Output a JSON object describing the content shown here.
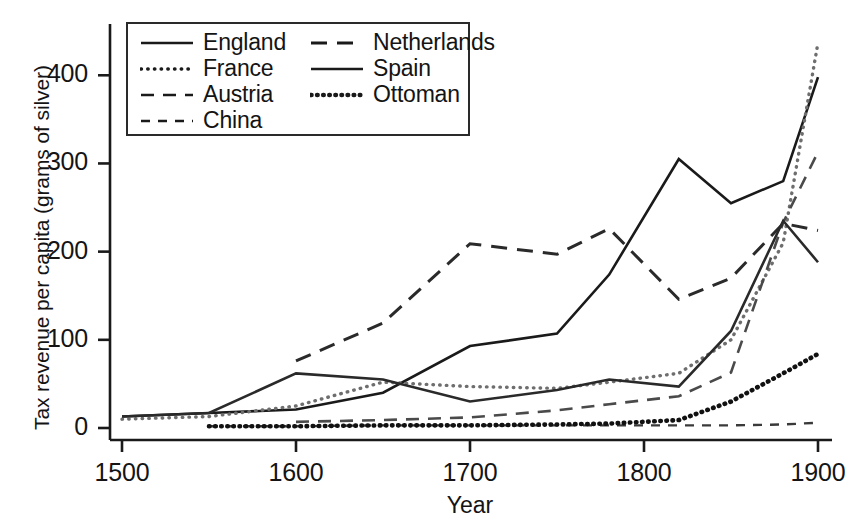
{
  "chart_data": {
    "type": "line",
    "title": "",
    "xlabel": "Year",
    "ylabel": "Tax revenue per capita (grams of silver)",
    "xlim": [
      1500,
      1900
    ],
    "ylim": [
      0,
      440
    ],
    "xticks": [
      1500,
      1600,
      1700,
      1800,
      1900
    ],
    "yticks": [
      0,
      100,
      200,
      300,
      400
    ],
    "xtick_labels": [
      "1500",
      "1600",
      "1700",
      "1800",
      "1900"
    ],
    "ytick_labels": [
      "0",
      "100",
      "200",
      "300",
      "400"
    ],
    "grid": false,
    "legend_position": "upper-left-inside",
    "series": [
      {
        "name": "England",
        "style": "solid",
        "color": "#1a1a1a",
        "points": [
          [
            1500,
            13
          ],
          [
            1550,
            17
          ],
          [
            1600,
            21
          ],
          [
            1650,
            40
          ],
          [
            1700,
            93
          ],
          [
            1750,
            107
          ],
          [
            1780,
            174
          ],
          [
            1820,
            305
          ],
          [
            1850,
            255
          ],
          [
            1880,
            280
          ],
          [
            1900,
            398
          ]
        ]
      },
      {
        "name": "France",
        "style": "dotted",
        "color": "#6e6e6e",
        "points": [
          [
            1500,
            10
          ],
          [
            1550,
            13
          ],
          [
            1600,
            25
          ],
          [
            1650,
            52
          ],
          [
            1700,
            47
          ],
          [
            1750,
            45
          ],
          [
            1780,
            52
          ],
          [
            1820,
            62
          ],
          [
            1850,
            100
          ],
          [
            1880,
            210
          ],
          [
            1900,
            437
          ]
        ]
      },
      {
        "name": "Austria",
        "style": "dashed-long",
        "color": "#4a4a4a",
        "points": [
          [
            1600,
            7
          ],
          [
            1650,
            9
          ],
          [
            1700,
            12
          ],
          [
            1750,
            20
          ],
          [
            1780,
            27
          ],
          [
            1820,
            36
          ],
          [
            1850,
            63
          ],
          [
            1880,
            233
          ],
          [
            1900,
            313
          ]
        ]
      },
      {
        "name": "China",
        "style": "dashed-short",
        "color": "#3a3a3a",
        "points": [
          [
            1550,
            2
          ],
          [
            1600,
            2
          ],
          [
            1650,
            3
          ],
          [
            1700,
            3
          ],
          [
            1750,
            3
          ],
          [
            1780,
            3
          ],
          [
            1820,
            3
          ],
          [
            1850,
            3
          ],
          [
            1880,
            4
          ],
          [
            1900,
            6
          ]
        ]
      },
      {
        "name": "Netherlands",
        "style": "dashed-med",
        "color": "#2a2a2a",
        "points": [
          [
            1600,
            76
          ],
          [
            1650,
            119
          ],
          [
            1700,
            209
          ],
          [
            1750,
            197
          ],
          [
            1780,
            226
          ],
          [
            1820,
            146
          ],
          [
            1850,
            170
          ],
          [
            1880,
            232
          ],
          [
            1900,
            224
          ]
        ]
      },
      {
        "name": "Spain",
        "style": "solid",
        "color": "#2a2a2a",
        "points": [
          [
            1500,
            13
          ],
          [
            1550,
            17
          ],
          [
            1600,
            62
          ],
          [
            1650,
            55
          ],
          [
            1700,
            30
          ],
          [
            1750,
            43
          ],
          [
            1780,
            55
          ],
          [
            1820,
            47
          ],
          [
            1850,
            110
          ],
          [
            1880,
            235
          ],
          [
            1900,
            188
          ]
        ]
      },
      {
        "name": "Ottoman",
        "style": "dotted-bold",
        "color": "#111111",
        "points": [
          [
            1550,
            2
          ],
          [
            1600,
            2
          ],
          [
            1650,
            3
          ],
          [
            1700,
            3
          ],
          [
            1750,
            4
          ],
          [
            1780,
            5
          ],
          [
            1820,
            9
          ],
          [
            1850,
            30
          ],
          [
            1880,
            62
          ],
          [
            1900,
            84
          ]
        ]
      }
    ]
  },
  "legend": {
    "columns": [
      {
        "items": [
          {
            "label": "England",
            "style": "solid"
          },
          {
            "label": "France",
            "style": "dotted"
          },
          {
            "label": "Austria",
            "style": "dashed-long"
          },
          {
            "label": "China",
            "style": "dashed-short"
          }
        ]
      },
      {
        "items": [
          {
            "label": "Netherlands",
            "style": "dashed-med"
          },
          {
            "label": "Spain",
            "style": "solid"
          },
          {
            "label": "Ottoman",
            "style": "dotted-bold"
          }
        ]
      }
    ]
  },
  "axis": {
    "x_label": "Year",
    "y_label": "Tax revenue per capita (grams of silver)",
    "x_tick_labels": [
      "1500",
      "1600",
      "1700",
      "1800",
      "1900"
    ],
    "y_tick_labels": [
      "0",
      "100",
      "200",
      "300",
      "400"
    ]
  },
  "colors": {
    "axis": "#1a1a1a",
    "background": "#ffffff",
    "ink": "#141414"
  }
}
